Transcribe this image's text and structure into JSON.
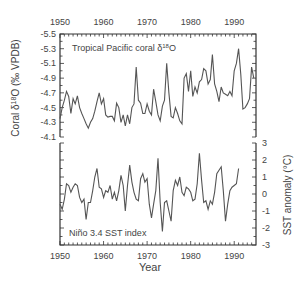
{
  "chart_data": [
    {
      "type": "line",
      "title": "Tropical Pacific coral δ18O",
      "xlabel": "Year",
      "ylabel": "Coral δ18O (‰ VPDB)",
      "y_inverted": true,
      "ylim": [
        -5.5,
        -4.1
      ],
      "yticks": [
        "-5.5",
        "-5.3",
        "-5.1",
        "-4.9",
        "-4.7",
        "-4.5",
        "-4.3",
        "-4.1"
      ],
      "xticks": [
        "1950",
        "1960",
        "1970",
        "1980",
        "1990"
      ],
      "xlim": [
        1950,
        1995
      ],
      "grid": false,
      "x": [
        1950,
        1950.5,
        1951,
        1951.5,
        1952,
        1952.5,
        1953,
        1953.5,
        1954,
        1954.5,
        1955,
        1955.5,
        1956,
        1956.5,
        1957,
        1957.5,
        1958,
        1958.5,
        1959,
        1959.5,
        1960,
        1960.5,
        1961,
        1961.5,
        1962,
        1962.5,
        1963,
        1963.5,
        1964,
        1964.5,
        1965,
        1965.5,
        1966,
        1966.5,
        1967,
        1967.5,
        1968,
        1968.5,
        1969,
        1969.5,
        1970,
        1970.5,
        1971,
        1971.5,
        1972,
        1972.5,
        1973,
        1973.5,
        1974,
        1974.5,
        1975,
        1975.5,
        1976,
        1976.5,
        1977,
        1977.5,
        1978,
        1978.5,
        1979,
        1979.5,
        1980,
        1980.5,
        1981,
        1981.5,
        1982,
        1982.5,
        1983,
        1983.5,
        1984,
        1984.5,
        1985,
        1985.5,
        1986,
        1986.5,
        1987,
        1987.5,
        1988,
        1988.5,
        1989,
        1989.5,
        1990,
        1990.5,
        1991,
        1991.5,
        1992,
        1992.5,
        1993,
        1993.5,
        1994,
        1994.5
      ],
      "values": [
        -4.35,
        -4.5,
        -4.6,
        -4.72,
        -4.65,
        -4.42,
        -4.62,
        -4.55,
        -4.66,
        -4.5,
        -4.42,
        -4.35,
        -4.28,
        -4.22,
        -4.3,
        -4.35,
        -4.45,
        -4.58,
        -4.7,
        -4.55,
        -4.62,
        -4.4,
        -4.37,
        -4.38,
        -4.38,
        -4.32,
        -4.56,
        -4.5,
        -4.3,
        -4.4,
        -4.25,
        -4.4,
        -4.28,
        -4.5,
        -4.55,
        -5.05,
        -4.6,
        -4.56,
        -4.42,
        -4.42,
        -4.55,
        -4.45,
        -4.4,
        -4.75,
        -4.58,
        -4.4,
        -4.32,
        -4.52,
        -4.6,
        -5.1,
        -4.7,
        -4.38,
        -4.36,
        -4.5,
        -4.42,
        -4.32,
        -4.28,
        -4.9,
        -4.96,
        -4.72,
        -5.0,
        -4.65,
        -4.78,
        -4.7,
        -4.85,
        -4.88,
        -5.03,
        -5.0,
        -4.82,
        -4.88,
        -5.22,
        -4.82,
        -4.72,
        -4.58,
        -4.78,
        -4.7,
        -4.68,
        -4.66,
        -4.72,
        -4.66,
        -5.0,
        -5.1,
        -5.3,
        -4.95,
        -4.48,
        -4.5,
        -4.55,
        -4.62,
        -5.05,
        -4.9,
        -5.15,
        -5.05,
        -5.08,
        -4.85,
        -5.12,
        -4.62,
        -4.85,
        -5.1,
        -4.72
      ],
      "annotations": [
        "Tropical Pacific coral δ18O"
      ]
    },
    {
      "type": "line",
      "title": "Niño 3.4 SST index",
      "xlabel": "Year",
      "ylabel": "SST anomaly (°C)",
      "ylim": [
        -3,
        3
      ],
      "yticks": [
        "3",
        "2",
        "1",
        "0",
        "-1",
        "-2",
        "-3"
      ],
      "xticks": [
        "1950",
        "1960",
        "1970",
        "1980",
        "1990"
      ],
      "xlim": [
        1950,
        1995
      ],
      "grid": false,
      "x": [
        1950,
        1950.5,
        1951,
        1951.5,
        1952,
        1952.5,
        1953,
        1953.5,
        1954,
        1954.5,
        1955,
        1955.5,
        1956,
        1956.5,
        1957,
        1957.5,
        1958,
        1958.5,
        1959,
        1959.5,
        1960,
        1960.5,
        1961,
        1961.5,
        1962,
        1962.5,
        1963,
        1963.5,
        1964,
        1964.5,
        1965,
        1965.5,
        1966,
        1966.5,
        1967,
        1967.5,
        1968,
        1968.5,
        1969,
        1969.5,
        1970,
        1970.5,
        1971,
        1971.5,
        1972,
        1972.5,
        1973,
        1973.5,
        1974,
        1974.5,
        1975,
        1975.5,
        1976,
        1976.5,
        1977,
        1977.5,
        1978,
        1978.5,
        1979,
        1979.5,
        1980,
        1980.5,
        1981,
        1981.5,
        1982,
        1982.5,
        1983,
        1983.5,
        1984,
        1984.5,
        1985,
        1985.5,
        1986,
        1986.5,
        1987,
        1987.5,
        1988,
        1988.5,
        1989,
        1989.5,
        1990,
        1990.5,
        1991,
        1991.5,
        1992
      ],
      "values": [
        -0.6,
        -0.9,
        -0.3,
        0.6,
        0.5,
        0.1,
        0.4,
        0.6,
        0.5,
        -0.2,
        -0.5,
        -0.3,
        -1.5,
        -0.5,
        -0.5,
        0.2,
        1.0,
        1.5,
        0.4,
        0.3,
        -0.2,
        0.2,
        0.1,
        0.5,
        -0.3,
        0.1,
        -0.4,
        0.2,
        1.1,
        0.5,
        -1.0,
        0.5,
        1.7,
        0.7,
        0.1,
        -0.3,
        -0.4,
        0.9,
        1.2,
        0.7,
        0.9,
        -0.6,
        -1.4,
        -0.6,
        0.2,
        2.1,
        -0.5,
        -2.2,
        -0.5,
        -0.4,
        -1.0,
        -1.6,
        0.2,
        0.8,
        0.5,
        1.0,
        0.1,
        -0.1,
        0.4,
        0.3,
        0.1,
        -0.4,
        -0.3,
        0.6,
        2.4,
        0.8,
        -0.5,
        -0.4,
        -0.9,
        -0.4,
        -0.6,
        0.1,
        1.2,
        1.4,
        1.6,
        0.2,
        -1.6,
        -0.6,
        0.2,
        0.4,
        0.5,
        0.6,
        1.5
      ],
      "annotations": [
        "Niño 3.4 SST index"
      ]
    }
  ],
  "labels": {
    "top_title": "Tropical Pacific coral δ",
    "top_title_sup": "18",
    "top_title_tail": "O",
    "bottom_title": "Niño 3.4 SST index",
    "left_axis_pre": "Coral δ",
    "left_axis_sup": "18",
    "left_axis_tail": "O (‰ VPDB)",
    "right_axis": "SST anomaly (°C)",
    "x_axis": "Year"
  }
}
